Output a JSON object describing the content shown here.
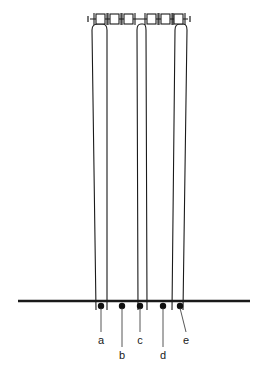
{
  "figure": {
    "kind": "line-diagram",
    "background_color": "#ffffff",
    "stroke_color": "#1a1a1a",
    "ground_line": {
      "name": "ground-line",
      "y": 301,
      "x_start": 18,
      "x_end": 250,
      "thickness": 2.2
    },
    "top_rod": {
      "name": "top-connector-rod",
      "y": 19,
      "x_start": 90,
      "x_end": 188,
      "blocks": 6
    },
    "tubes": [
      {
        "name": "tube-1",
        "top_left_x": 92,
        "top_right_x": 107,
        "bottom_left_x": 96,
        "bottom_right_x": 107,
        "top_y": 24,
        "bottom_y": 310
      },
      {
        "name": "tube-2",
        "top_left_x": 137,
        "top_right_x": 146,
        "bottom_left_x": 138,
        "bottom_right_x": 147,
        "top_y": 24,
        "bottom_y": 310
      },
      {
        "name": "tube-3",
        "top_left_x": 175,
        "top_right_x": 187,
        "bottom_left_x": 172,
        "bottom_right_x": 183,
        "top_y": 24,
        "bottom_y": 310
      }
    ],
    "points": [
      {
        "id": "a",
        "label": "a",
        "dot_x": 101,
        "dot_y": 306,
        "label_x": 101,
        "label_y": 340,
        "leader_to_y": 334
      },
      {
        "id": "b",
        "label": "b",
        "dot_x": 122,
        "dot_y": 306,
        "label_x": 122,
        "label_y": 355,
        "leader_to_y": 349
      },
      {
        "id": "c",
        "label": "c",
        "dot_x": 140,
        "dot_y": 306,
        "label_x": 140,
        "label_y": 340,
        "leader_to_y": 334
      },
      {
        "id": "d",
        "label": "d",
        "dot_x": 163,
        "dot_y": 306,
        "label_x": 163,
        "label_y": 355,
        "leader_to_y": 349
      },
      {
        "id": "e",
        "label": "e",
        "dot_x": 180,
        "dot_y": 306,
        "label_x": 186,
        "label_y": 340,
        "leader_to_y": 334
      }
    ],
    "dot_radius": 3.2,
    "labels_text": [
      "a",
      "b",
      "c",
      "d",
      "e"
    ]
  }
}
